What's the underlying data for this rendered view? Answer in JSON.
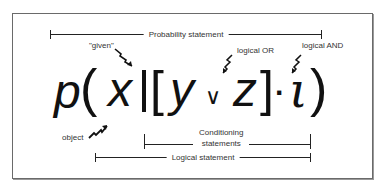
{
  "diagram": {
    "formula": {
      "p": "p",
      "open_paren": "(",
      "x": "x",
      "given_bar": "|",
      "open_bracket": "[",
      "y": "y",
      "or_symbol": "∨",
      "z": "z",
      "close_bracket": "]",
      "and_symbol": "·",
      "i": "ι",
      "close_paren": ")"
    },
    "brackets": {
      "probability_statement": "Probability statement",
      "conditioning_statements_line1": "Conditioning",
      "conditioning_statements_line2": "statements",
      "logical_statement": "Logical statement"
    },
    "annotations": {
      "given": "\"given\"",
      "logical_or": "logical OR",
      "logical_and": "logical AND",
      "object": "object"
    },
    "colors": {
      "border": "#6a6a6a",
      "ink": "#111111",
      "label": "#333333",
      "background": "#ffffff"
    }
  }
}
